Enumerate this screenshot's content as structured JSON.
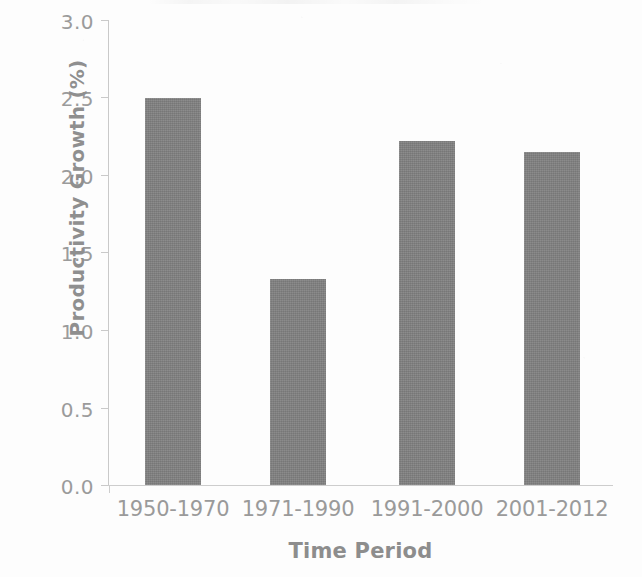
{
  "chart_data": {
    "type": "bar",
    "title": "",
    "xlabel": "Time Period",
    "ylabel": "Productivity Growth (%)",
    "categories": [
      "1950-1970",
      "1971-1990",
      "1991-2000",
      "2001-2012"
    ],
    "values": [
      2.5,
      1.33,
      2.22,
      2.15
    ],
    "ylim": [
      0.0,
      3.0
    ],
    "ytick_labels": [
      "3.0",
      "2.5",
      "2.0",
      "1.5",
      "1.0",
      "0.5",
      "0.0"
    ],
    "ytick_values": [
      3.0,
      2.5,
      2.0,
      1.5,
      1.0,
      0.5,
      0.0
    ],
    "ytick_step": 0.5,
    "grid": false,
    "legend": false,
    "legend_position": "none",
    "series": [
      {
        "name": "Productivity Growth (%)",
        "values": [
          2.5,
          1.33,
          2.22,
          2.15
        ]
      }
    ],
    "bar_color": "#7f7f7f",
    "axis_color": "#c9c9c9",
    "text_color": "#9a9a9a"
  },
  "axes": {
    "y_title": "Productivity Growth (%)",
    "x_title": "Time Period"
  },
  "ticks": {
    "y": [
      {
        "label": "3.0",
        "value": 3.0
      },
      {
        "label": "2.5",
        "value": 2.5
      },
      {
        "label": "2.0",
        "value": 2.0
      },
      {
        "label": "1.5",
        "value": 1.5
      },
      {
        "label": "1.0",
        "value": 1.0
      },
      {
        "label": "0.5",
        "value": 0.5
      },
      {
        "label": "0.0",
        "value": 0.0
      }
    ]
  },
  "bars": [
    {
      "category": "1950-1970",
      "value": 2.5
    },
    {
      "category": "1971-1990",
      "value": 1.33
    },
    {
      "category": "1991-2000",
      "value": 2.22
    },
    {
      "category": "2001-2012",
      "value": 2.15
    }
  ]
}
